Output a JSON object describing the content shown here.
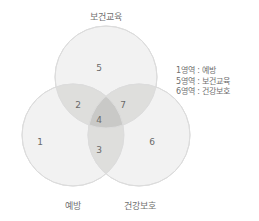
{
  "figure": {
    "type": "venn-3-circle",
    "background_color": "#ffffff",
    "text_color": "#6b6b6b"
  },
  "labels": {
    "top": "보건교육",
    "bottom_left": "예방",
    "bottom_right": "건강보호"
  },
  "circles": [
    {
      "name": "보건교육",
      "cx": 106,
      "cy": 77,
      "r": 51,
      "position": "top"
    },
    {
      "name": "예방",
      "cx": 73,
      "cy": 135,
      "r": 51,
      "position": "bottom-left"
    },
    {
      "name": "건강보호",
      "cx": 139,
      "cy": 135,
      "r": 51,
      "position": "bottom-right"
    }
  ],
  "regions": [
    {
      "id": "1",
      "label": "1",
      "belongs_to": [
        "예방"
      ],
      "x": 40,
      "y": 142,
      "shade": "light"
    },
    {
      "id": "2",
      "label": "2",
      "belongs_to": [
        "보건교육",
        "예방"
      ],
      "x": 78,
      "y": 105,
      "shade": "medium"
    },
    {
      "id": "3",
      "label": "3",
      "belongs_to": [
        "예방",
        "건강보호"
      ],
      "x": 99,
      "y": 150,
      "shade": "medium"
    },
    {
      "id": "4",
      "label": "4",
      "belongs_to": [
        "보건교육",
        "예방",
        "건강보호"
      ],
      "x": 99,
      "y": 120,
      "shade": "dark"
    },
    {
      "id": "5",
      "label": "5",
      "belongs_to": [
        "보건교육"
      ],
      "x": 99,
      "y": 68,
      "shade": "light"
    },
    {
      "id": "6",
      "label": "6",
      "belongs_to": [
        "건강보호"
      ],
      "x": 152,
      "y": 142,
      "shade": "light"
    },
    {
      "id": "7",
      "label": "7",
      "belongs_to": [
        "보건교육",
        "건강보호"
      ],
      "x": 123,
      "y": 105,
      "shade": "medium"
    }
  ],
  "legend": {
    "lines": [
      "1영역 : 예방",
      "5영역 : 보건교육",
      "6영역 : 건강보호"
    ]
  },
  "colors": {
    "circle_fill": "#f2f2f2",
    "circle_stroke": "#dcdcdc",
    "overlap_pair": "#dededc",
    "overlap_triple": "#c9c9c7"
  }
}
